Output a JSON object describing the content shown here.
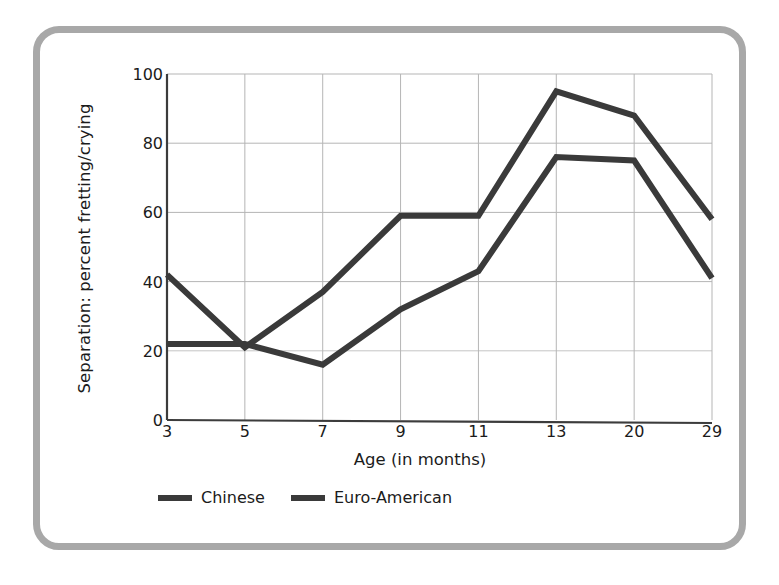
{
  "chart_data": {
    "type": "line",
    "title": "",
    "xlabel": "Age (in months)",
    "ylabel": "Separation: percent fretting/crying",
    "categories": [
      "3",
      "5",
      "7",
      "9",
      "11",
      "13",
      "20",
      "29"
    ],
    "xlim": [
      0,
      7
    ],
    "ylim": [
      0,
      100
    ],
    "yticks": [
      "0",
      "20",
      "40",
      "60",
      "80",
      "100"
    ],
    "ytick_values": [
      0,
      20,
      40,
      60,
      80,
      100
    ],
    "grid": "both-axes-light-gray",
    "legend_position": "below-plot-left",
    "series": [
      {
        "name": "Chinese",
        "color": "#3a3a3a",
        "values": [
          22,
          22,
          16,
          32,
          43,
          76,
          75,
          41
        ]
      },
      {
        "name": "Euro-American",
        "color": "#3a3a3a",
        "values": [
          42,
          21,
          37,
          59,
          59,
          95,
          88,
          58
        ]
      }
    ]
  },
  "frame": {
    "border_color": "#a8a8a8",
    "background": "#ffffff"
  },
  "axes": {
    "axis_line_color": "#3c3c3c",
    "grid_color": "#b5b5b5"
  }
}
